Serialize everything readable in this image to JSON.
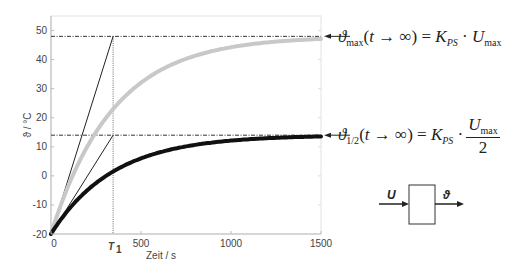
{
  "chart_data": {
    "type": "line",
    "title": "",
    "xlabel": "Zeit / s",
    "ylabel": "ϑ / °C",
    "xlim": [
      0,
      1500
    ],
    "ylim": [
      -20,
      55
    ],
    "xticks": [
      0,
      500,
      1000,
      1500
    ],
    "xtick_labels": [
      "0",
      "500",
      "1000",
      "1500"
    ],
    "yticks": [
      -20,
      -10,
      0,
      10,
      20,
      30,
      40,
      50
    ],
    "ytick_labels": [
      "-20",
      "-10",
      "0",
      "10",
      "20",
      "30",
      "40",
      "50"
    ],
    "grid": false,
    "legend": null,
    "T1": 345,
    "T1_label": "T",
    "T1_subscript": "1",
    "series": [
      {
        "name": "ϑ_max (U_max)",
        "color": "#c8c8c8",
        "linewidth": 4,
        "model": "first-order step response",
        "start": -20,
        "final": 48,
        "time_constant": 345,
        "x": [
          0,
          100,
          200,
          345,
          500,
          700,
          1000,
          1250,
          1500
        ],
        "values": [
          -20,
          -2.9,
          8.9,
          23.0,
          32.1,
          39.1,
          44.2,
          46.0,
          47.1
        ]
      },
      {
        "name": "ϑ_1/2 (U_max/2)",
        "color": "#111111",
        "linewidth": 4,
        "model": "first-order step response",
        "start": -20,
        "final": 14,
        "time_constant": 345,
        "x": [
          0,
          100,
          200,
          345,
          500,
          700,
          1000,
          1250,
          1500
        ],
        "values": [
          -20,
          -11.5,
          -5.5,
          1.5,
          6.0,
          9.6,
          12.1,
          13.0,
          13.6
        ]
      }
    ],
    "reference_lines": [
      {
        "type": "hline",
        "y": 48,
        "style": "dash-dot",
        "label": "ϑ_max(t→∞)"
      },
      {
        "type": "hline",
        "y": 14,
        "style": "dash-dot",
        "label": "ϑ_1/2(t→∞)"
      },
      {
        "type": "vline",
        "x": 345,
        "style": "dotted",
        "label": "T1"
      },
      {
        "type": "tangent",
        "from": [
          0,
          -20
        ],
        "to": [
          345,
          48
        ]
      },
      {
        "type": "tangent",
        "from": [
          0,
          -20
        ],
        "to": [
          345,
          14
        ]
      }
    ],
    "annotations": [
      {
        "text": "ϑmax(t → ∞) = KPS · Umax",
        "points_to_y": 48
      },
      {
        "text": "ϑ1/2(t → ∞) = KPS · Umax / 2",
        "points_to_y": 14
      }
    ],
    "block_diagram": {
      "input": "U",
      "output": "ϑ"
    }
  },
  "equations": {
    "max": {
      "theta": "ϑ",
      "theta_sub": "max",
      "arg": "(t → ∞) = ",
      "k": "K",
      "k_sub": "PS",
      "dot": " · ",
      "u": "U",
      "u_sub": "max"
    },
    "half": {
      "theta": "ϑ",
      "theta_sub": "1/2",
      "arg": "(t → ∞) = ",
      "k": "K",
      "k_sub": "PS",
      "dot": " · ",
      "num": "U",
      "num_sub": "max",
      "den": "2"
    }
  },
  "block": {
    "input_label": "U",
    "output_label": "ϑ"
  }
}
